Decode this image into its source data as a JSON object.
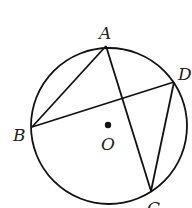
{
  "diagram": {
    "type": "circle-geometry",
    "circle": {
      "cx": 109,
      "cy": 126,
      "r": 78,
      "stroke": "#111111"
    },
    "center": {
      "x": 108,
      "y": 125,
      "label": "O",
      "label_x": 101,
      "label_y": 150
    },
    "points": {
      "A": {
        "x": 106,
        "y": 46,
        "label": "A",
        "label_x": 99,
        "label_y": 39
      },
      "B": {
        "x": 32,
        "y": 127,
        "label": "B",
        "label_x": 13,
        "label_y": 141
      },
      "C": {
        "x": 151,
        "y": 191,
        "label": "C",
        "label_x": 147,
        "label_y": 214
      },
      "D": {
        "x": 174,
        "y": 82,
        "label": "D",
        "label_x": 178,
        "label_y": 80
      }
    },
    "segments": [
      {
        "from": "A",
        "to": "B"
      },
      {
        "from": "A",
        "to": "C"
      },
      {
        "from": "B",
        "to": "D"
      },
      {
        "from": "D",
        "to": "C"
      }
    ]
  }
}
